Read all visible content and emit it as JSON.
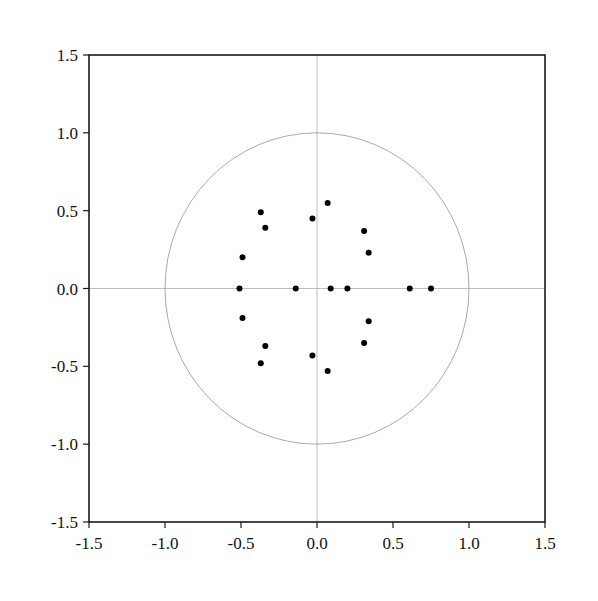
{
  "chart_data": {
    "type": "scatter",
    "title": "",
    "xlabel": "",
    "ylabel": "",
    "xlim": [
      -1.5,
      1.5
    ],
    "ylim": [
      -1.5,
      1.5
    ],
    "xticks": [
      "-1.5",
      "-1.0",
      "-0.5",
      "0.0",
      "0.5",
      "1.0",
      "1.5"
    ],
    "yticks": [
      "1.5",
      "1.0",
      "0.5",
      "0.0",
      "-0.5",
      "-1.0",
      "-1.5"
    ],
    "grid": false,
    "reference_lines": {
      "x0": true,
      "y0": true
    },
    "unit_circle": {
      "center": [
        0,
        0
      ],
      "radius": 1.0
    },
    "series": [
      {
        "name": "points",
        "color": "#000000",
        "points": [
          [
            -0.37,
            0.49
          ],
          [
            -0.34,
            0.39
          ],
          [
            -0.03,
            0.45
          ],
          [
            0.07,
            0.55
          ],
          [
            0.31,
            0.37
          ],
          [
            0.34,
            0.23
          ],
          [
            -0.49,
            0.2
          ],
          [
            -0.51,
            0.0
          ],
          [
            -0.14,
            0.0
          ],
          [
            0.09,
            0.0
          ],
          [
            0.2,
            0.0
          ],
          [
            0.61,
            0.0
          ],
          [
            0.75,
            0.0
          ],
          [
            -0.49,
            -0.19
          ],
          [
            0.34,
            -0.21
          ],
          [
            0.31,
            -0.35
          ],
          [
            -0.34,
            -0.37
          ],
          [
            -0.37,
            -0.48
          ],
          [
            -0.03,
            -0.43
          ],
          [
            0.07,
            -0.53
          ]
        ]
      }
    ]
  },
  "colors": {
    "axis": "#1a1a1a",
    "circle": "#a0a0a0",
    "crosshair": "#b5b5b5",
    "point": "#000000"
  }
}
